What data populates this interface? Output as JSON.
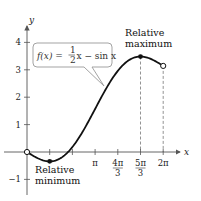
{
  "chart_data": {
    "type": "line",
    "title": "",
    "function_label": "f(x) = ½x − sin x",
    "function_parts": {
      "lhs": "f(x) =",
      "num": "1",
      "den": "2",
      "rhs": "x − sin x"
    },
    "xlabel": "x",
    "ylabel": "y",
    "xlim": [
      0,
      6.2832
    ],
    "ylim": [
      -1,
      4
    ],
    "x_ticks": [
      {
        "value": 1.0472,
        "label": ""
      },
      {
        "value": 2.0944,
        "label": ""
      },
      {
        "value": 3.1416,
        "label": "π"
      },
      {
        "value": 4.1888,
        "label": "4π/3",
        "num": "4π",
        "den": "3"
      },
      {
        "value": 5.236,
        "label": "5π/3",
        "num": "5π",
        "den": "3"
      },
      {
        "value": 6.2832,
        "label": "2π"
      }
    ],
    "y_ticks": [
      {
        "value": -1,
        "label": "−1"
      },
      {
        "value": 1,
        "label": "1"
      },
      {
        "value": 2,
        "label": "2"
      },
      {
        "value": 3,
        "label": "3"
      },
      {
        "value": 4,
        "label": "4"
      }
    ],
    "series": [
      {
        "name": "f(x) = x/2 − sin x",
        "x": [
          0,
          0.5236,
          1.0472,
          1.5708,
          2.0944,
          2.618,
          3.1416,
          3.6652,
          4.1888,
          4.7124,
          5.236,
          5.7596,
          6.2832
        ],
        "y": [
          0,
          -0.238,
          -0.342,
          -0.215,
          0.181,
          0.809,
          1.571,
          2.333,
          2.96,
          3.356,
          3.484,
          3.38,
          3.142
        ]
      }
    ],
    "points": [
      {
        "x": 0,
        "y": 0,
        "style": "open"
      },
      {
        "x": 1.0472,
        "y": -0.342,
        "style": "filled",
        "label": "Relative minimum"
      },
      {
        "x": 5.236,
        "y": 3.484,
        "style": "filled",
        "label": "Relative maximum"
      },
      {
        "x": 6.2832,
        "y": 3.142,
        "style": "open"
      }
    ],
    "annotations": {
      "max_line1": "Relative",
      "max_line2": "maximum",
      "min_line1": "Relative",
      "min_line2": "minimum"
    },
    "grid": false,
    "dashed_guides_at_x": [
      5.236,
      6.2832
    ]
  }
}
